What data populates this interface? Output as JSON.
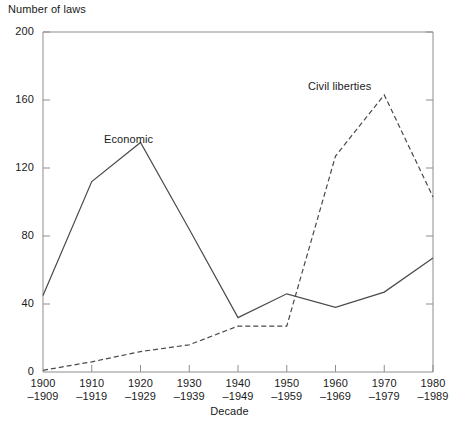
{
  "chart_data": {
    "type": "line",
    "title": "",
    "xlabel": "Decade",
    "ylabel": "Number of laws",
    "ylim": [
      0,
      200
    ],
    "yticks": [
      0,
      40,
      80,
      120,
      160,
      200
    ],
    "ytick_labels": [
      "0",
      "40",
      "80",
      "120",
      "160",
      "200"
    ],
    "grid": false,
    "legend_position": "inline-annotation",
    "categories": [
      "1900–1909",
      "1910–1919",
      "1920–1929",
      "1930–1939",
      "1940–1949",
      "1950–1959",
      "1960–1969",
      "1970–1979",
      "1980–1989"
    ],
    "category_lines": [
      [
        "1900",
        "–1909"
      ],
      [
        "1910",
        "–1919"
      ],
      [
        "1920",
        "–1929"
      ],
      [
        "1930",
        "–1939"
      ],
      [
        "1940",
        "–1949"
      ],
      [
        "1950",
        "–1959"
      ],
      [
        "1960",
        "–1969"
      ],
      [
        "1970",
        "–1979"
      ],
      [
        "1980",
        "–1989"
      ]
    ],
    "series": [
      {
        "name": "Economic",
        "style": "solid",
        "color": "#4a4a4a",
        "values": [
          45,
          112,
          135,
          84,
          32,
          46,
          38,
          47,
          67
        ]
      },
      {
        "name": "Civil liberties",
        "style": "dashed",
        "color": "#4a4a4a",
        "values": [
          1,
          6,
          12,
          16,
          27,
          27,
          127,
          163,
          103
        ]
      }
    ],
    "annotations": [
      {
        "text": "Economic",
        "series": "Economic",
        "x_px": 104,
        "y_px": 133
      },
      {
        "text": "Civil liberties",
        "series": "Civil liberties",
        "x_px": 308,
        "y_px": 80
      }
    ]
  },
  "axes": {
    "y_title": "Number of laws",
    "x_title": "Decade"
  },
  "caption": {
    "text": ""
  }
}
